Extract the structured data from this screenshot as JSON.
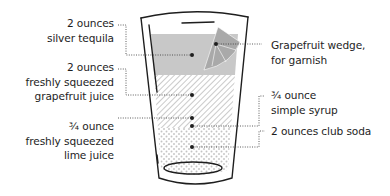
{
  "diagram": {
    "title": "",
    "labels_left": [
      {
        "lines": [
          "2 ounces",
          "silver tequila"
        ]
      },
      {
        "lines": [
          "2 ounces",
          "freshly squeezed",
          "grapefruit juice"
        ]
      },
      {
        "lines": [
          "¾ ounce",
          "freshly squeezed",
          "lime juice"
        ]
      }
    ],
    "labels_right": [
      {
        "lines": [
          "Grapefruit wedge,",
          "for garnish"
        ]
      },
      {
        "lines": [
          "¾ ounce",
          "simple syrup"
        ]
      },
      {
        "lines": [
          "2 ounces club soda"
        ]
      }
    ],
    "colors": {
      "ink": "#1e1e1e",
      "tequila_fill": "#c8c8c8",
      "hatch": "#bdbdbd",
      "dots": "#c4c4c4",
      "wedge": "#a9a9a9"
    }
  }
}
